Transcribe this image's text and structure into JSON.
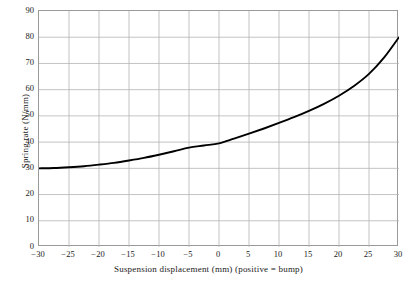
{
  "chart_data": {
    "type": "line",
    "title": "",
    "xlabel": "Suspension displacement (mm) (positive = bump)",
    "ylabel": "Spring rate (N/mm)",
    "xlim": [
      -30,
      30
    ],
    "ylim": [
      0,
      90
    ],
    "xticks": [
      -30,
      -25,
      -20,
      -15,
      -10,
      -5,
      0,
      5,
      10,
      15,
      20,
      25,
      30
    ],
    "yticks": [
      0,
      10,
      20,
      30,
      40,
      50,
      60,
      70,
      80,
      90
    ],
    "xtick_labels": [
      "−30",
      "−25",
      "−20",
      "−15",
      "−10",
      "−5",
      "0",
      "5",
      "10",
      "15",
      "20",
      "25",
      "30"
    ],
    "ytick_labels": [
      "0",
      "10",
      "20",
      "30",
      "40",
      "50",
      "60",
      "70",
      "80",
      "90"
    ],
    "grid": true,
    "legend": null,
    "series": [
      {
        "name": "Spring rate",
        "color": "#000000",
        "x": [
          -30,
          -27.5,
          -25,
          -22.5,
          -20,
          -17.5,
          -15,
          -12.5,
          -10,
          -7.5,
          -5,
          -2.5,
          0,
          2.5,
          5,
          7.5,
          10,
          12.5,
          15,
          17.5,
          20,
          22.5,
          25,
          27.5,
          30
        ],
        "y": [
          30.0,
          30.1,
          30.4,
          30.8,
          31.4,
          32.1,
          33.0,
          34.0,
          35.2,
          36.5,
          37.9,
          38.7,
          39.5,
          41.3,
          43.2,
          45.2,
          47.3,
          49.5,
          51.9,
          54.6,
          57.7,
          61.4,
          66.0,
          72.2,
          80.0
        ]
      }
    ]
  },
  "axis": {
    "x_label_text": "Suspension displacement (mm) (positive = bump)",
    "y_label_text": "Spring rate (N/mm)"
  },
  "style": {
    "grid_color": "#b4b4b4",
    "frame_color": "#9a9a9a",
    "curve_color": "#000000",
    "background": "#ffffff",
    "text_color": "#1a1a1a"
  }
}
